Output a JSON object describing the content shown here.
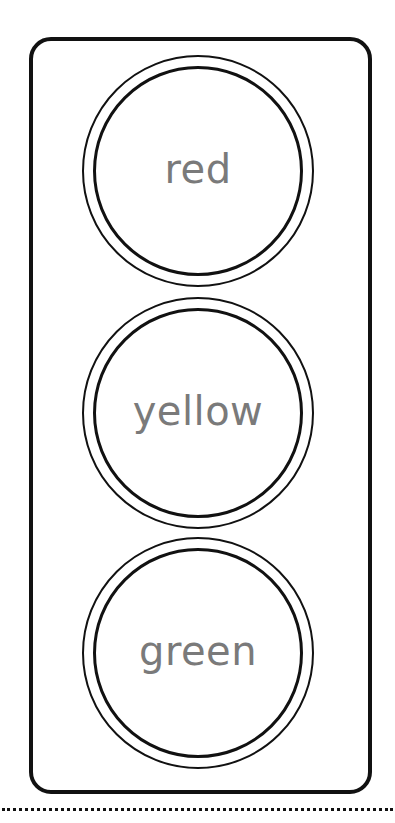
{
  "traffic_light": {
    "lights": [
      {
        "label": "red"
      },
      {
        "label": "yellow"
      },
      {
        "label": "green"
      }
    ]
  },
  "colors": {
    "outline": "#111111",
    "label_text": "#7a7a7a",
    "background": "#ffffff"
  }
}
